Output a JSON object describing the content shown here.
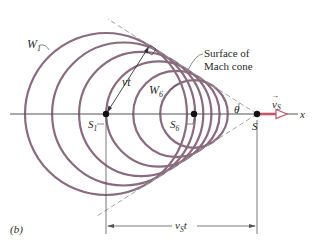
{
  "figure": {
    "panel_label": "(b)",
    "colors": {
      "wavefront": "#8a6a7e",
      "axis": "#555555",
      "dashed": "#9a9a9a",
      "velocity_arrow": "#c2556a",
      "dot": "#111111",
      "text": "#2a2a2a"
    },
    "labels": {
      "w1": "W",
      "w1_sub": "1",
      "w6": "W",
      "w6_sub": "6",
      "vt": "vt",
      "surface_line1": "Surface of",
      "surface_line2": "Mach cone",
      "s1": "S",
      "s1_sub": "1",
      "s6": "S",
      "s6_sub": "6",
      "s": "S",
      "theta": "θ",
      "vs_vec": "v",
      "vs_sub": "S",
      "vs_arrow": "→",
      "x_axis": "x",
      "vst": "v",
      "vst_sub": "S",
      "vst_t": "t"
    },
    "wavefronts": [
      {
        "name": "W1",
        "cx": 106,
        "r": 81
      },
      {
        "name": "W2",
        "cx": 123.6,
        "r": 71.5
      },
      {
        "name": "W3",
        "cx": 141.2,
        "r": 62.1
      },
      {
        "name": "W4",
        "cx": 158.8,
        "r": 52.6
      },
      {
        "name": "W5",
        "cx": 176.4,
        "r": 43.2
      },
      {
        "name": "W6",
        "cx": 194,
        "r": 33.8
      }
    ],
    "source_position_x": 257,
    "axis_y": 114
  }
}
